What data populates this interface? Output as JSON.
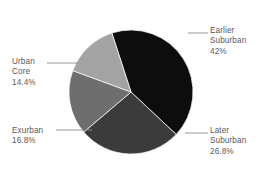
{
  "chart_data": {
    "type": "pie",
    "title": "",
    "subtitle": "",
    "xlabel": "",
    "ylabel": "",
    "legend_position": "none",
    "grid": false,
    "labels_outside": true,
    "categories": [
      "Earlier Suburban",
      "Later Suburban",
      "Exurban",
      "Urban Core"
    ],
    "values": [
      42,
      26.8,
      16.8,
      14.4
    ],
    "value_labels": [
      "42%",
      "26.8%",
      "16.8%",
      "14.4%"
    ],
    "colors": [
      "#0d0d0d",
      "#3b3b3b",
      "#6e6e6e",
      "#a3a3a3"
    ],
    "slices": [
      {
        "name": "Earlier Suburban",
        "name_line1": "Earlier",
        "name_line2": "Suburban",
        "value": 42,
        "value_label": "42%",
        "color": "#0d0d0d"
      },
      {
        "name": "Later Suburban",
        "name_line1": "Later",
        "name_line2": "Suburban",
        "value": 26.8,
        "value_label": "26.8%",
        "color": "#3b3b3b"
      },
      {
        "name": "Exurban",
        "name_line1": "Exurban",
        "name_line2": "",
        "value": 16.8,
        "value_label": "16.8%",
        "color": "#6e6e6e"
      },
      {
        "name": "Urban Core",
        "name_line1": "Urban",
        "name_line2": "Core",
        "value": 14.4,
        "value_label": "14.4%",
        "color": "#a3a3a3"
      }
    ]
  },
  "style": {
    "background": "#ffffff",
    "text_color": "#5a5a5a",
    "leader_color": "#8c8c8c"
  }
}
